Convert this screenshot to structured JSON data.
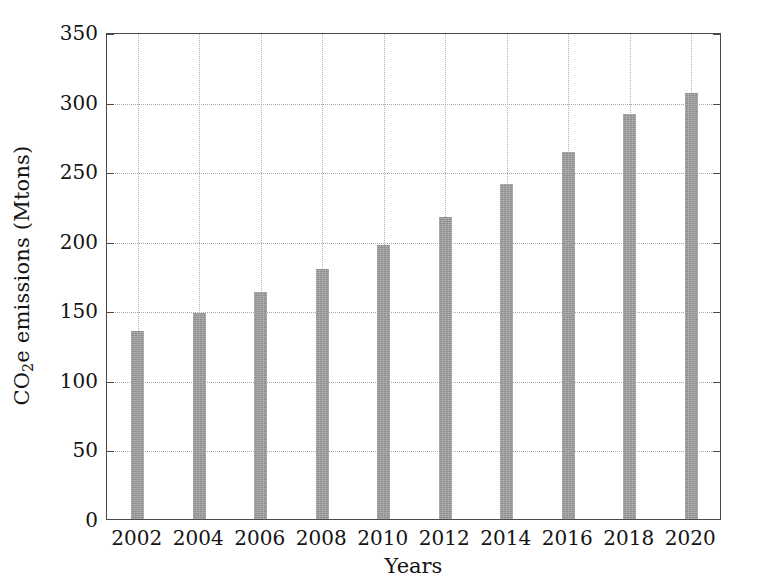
{
  "chart_data": {
    "type": "bar",
    "title": "",
    "xlabel": "Years",
    "ylabel": "CO2e emissions (Mtons)",
    "ylabel_parts": {
      "pre": "CO",
      "sub": "2",
      "post": "e emissions (Mtons)"
    },
    "categories": [
      "2002",
      "2004",
      "2006",
      "2008",
      "2010",
      "2012",
      "2014",
      "2016",
      "2018",
      "2020"
    ],
    "values": [
      135,
      148,
      163,
      180,
      197,
      217,
      241,
      264,
      291,
      306
    ],
    "ylim": [
      0,
      350
    ],
    "yticks": [
      0,
      50,
      100,
      150,
      200,
      250,
      300,
      350
    ],
    "ytick_labels": [
      "0",
      "50",
      "100",
      "150",
      "200",
      "250",
      "300",
      "350"
    ],
    "grid": true,
    "grid_style": "dotted",
    "legend": null,
    "bar_color": "#9b9b9b",
    "axis_color": "#4a4a4a",
    "grid_color": "#a7a7a7",
    "background": "#ffffff"
  }
}
